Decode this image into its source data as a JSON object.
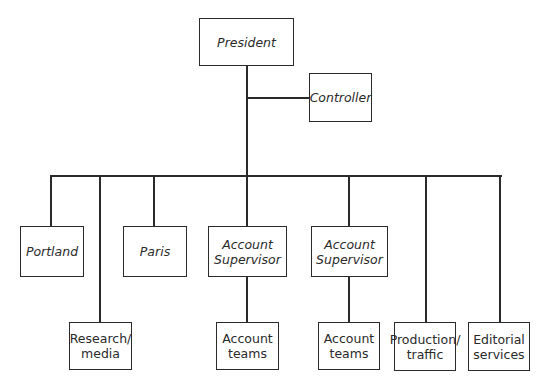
{
  "diagram": {
    "type": "org-chart",
    "nodes": {
      "president": "President",
      "controller": "Controller",
      "portland": "Portland",
      "paris": "Paris",
      "account_supervisor_1": "Account\nSupervisor",
      "account_supervisor_2": "Account\nSupervisor",
      "research_media": "Research/\nmedia",
      "account_teams_1": "Account\nteams",
      "account_teams_2": "Account\nteams",
      "production_traffic": "Production/\ntraffic",
      "editorial_services": "Editorial\nservices"
    },
    "edges": [
      [
        "president",
        "controller"
      ],
      [
        "president",
        "portland"
      ],
      [
        "president",
        "research_media"
      ],
      [
        "president",
        "paris"
      ],
      [
        "president",
        "account_supervisor_1"
      ],
      [
        "president",
        "account_supervisor_2"
      ],
      [
        "president",
        "production_traffic"
      ],
      [
        "president",
        "editorial_services"
      ],
      [
        "account_supervisor_1",
        "account_teams_1"
      ],
      [
        "account_supervisor_2",
        "account_teams_2"
      ]
    ]
  }
}
